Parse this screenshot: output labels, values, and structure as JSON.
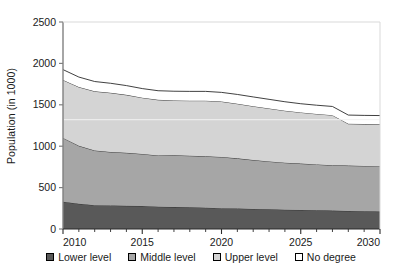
{
  "chart_data": {
    "type": "area",
    "stacked": true,
    "title": "",
    "xlabel": "",
    "ylabel": "Population (in 1000)",
    "xlim": [
      2010,
      2030
    ],
    "ylim": [
      0,
      2500
    ],
    "yticks": [
      0,
      500,
      1000,
      1500,
      2000,
      2500
    ],
    "ytick_labels": [
      "0",
      "500",
      "1000",
      "1500",
      "2000",
      "2500"
    ],
    "xticks": [
      2010,
      2015,
      2020,
      2025,
      2030
    ],
    "xtick_labels": [
      "2010",
      "2015",
      "2020",
      "2025",
      "2030"
    ],
    "xticks_minor": [
      2011,
      2012,
      2013,
      2014,
      2016,
      2017,
      2018,
      2019,
      2021,
      2022,
      2023,
      2024,
      2026,
      2027,
      2028,
      2029
    ],
    "grid": false,
    "legend_position": "bottom",
    "x": [
      2010,
      2011,
      2012,
      2013,
      2014,
      2015,
      2016,
      2017,
      2018,
      2019,
      2020,
      2021,
      2022,
      2023,
      2024,
      2025,
      2026,
      2027,
      2028,
      2029,
      2030
    ],
    "series": [
      {
        "name": "Lower level",
        "color": "#595959",
        "values": [
          330,
          305,
          288,
          285,
          280,
          278,
          270,
          265,
          262,
          258,
          252,
          248,
          243,
          238,
          233,
          230,
          226,
          222,
          218,
          214,
          210
        ]
      },
      {
        "name": "Middle level",
        "color": "#a6a6a6",
        "values": [
          770,
          700,
          660,
          645,
          640,
          628,
          618,
          625,
          623,
          620,
          618,
          605,
          590,
          578,
          568,
          560,
          554,
          548,
          548,
          548,
          545
        ]
      },
      {
        "name": "Upper level",
        "color": "#d4d4d4",
        "values": [
          700,
          710,
          715,
          715,
          700,
          680,
          672,
          662,
          665,
          672,
          670,
          660,
          650,
          640,
          628,
          618,
          610,
          605,
          505,
          505,
          510
        ]
      },
      {
        "name": "No degree",
        "color": "#ffffff",
        "values": [
          125,
          120,
          118,
          115,
          112,
          110,
          110,
          112,
          112,
          112,
          110,
          112,
          112,
          110,
          108,
          105,
          105,
          105,
          105,
          105,
          105
        ]
      }
    ],
    "cumulative_totals": [
      1925,
      1835,
      1781,
      1760,
      1732,
      1696,
      1670,
      1664,
      1662,
      1662,
      1650,
      1625,
      1595,
      1566,
      1537,
      1513,
      1495,
      1480,
      1376,
      1372,
      1370
    ]
  },
  "legend": {
    "items": [
      {
        "label": "Lower level",
        "color": "#595959"
      },
      {
        "label": "Middle level",
        "color": "#a6a6a6"
      },
      {
        "label": "Upper level",
        "color": "#d4d4d4"
      },
      {
        "label": "No degree",
        "color": "#ffffff"
      }
    ]
  },
  "axes": {
    "y_title": "Population (in 1000)"
  }
}
